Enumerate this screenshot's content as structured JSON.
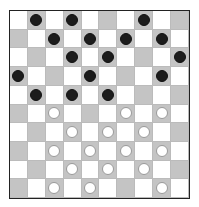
{
  "game": "checkers",
  "board": {
    "size": 10,
    "colors": {
      "light": "#ffffff",
      "dark": "#c4c4c4",
      "black_piece": "#1c1c1c",
      "white_piece": "#ffffff"
    },
    "rows": [
      ".b.b...b..",
      "..b.b.b.b.",
      "...b.b...b",
      "b...b...b.",
      ".b.b.b....",
      "..w...w.w.",
      "...w.w.w..",
      "..w.w.w.w.",
      "...w.w.w..",
      "..w.w...w."
    ]
  },
  "pieces": {
    "black_count": 16,
    "white_count": 16
  }
}
